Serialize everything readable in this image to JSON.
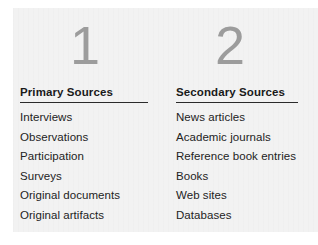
{
  "figure": {
    "background_color": "#ffffff",
    "panel_color": "#f2f2f2",
    "numeral_color": "#9c9c9c",
    "heading_color": "#1a1a1a",
    "text_color": "#232323",
    "rule_color": "#2b2b2b"
  },
  "columns": [
    {
      "number": "1",
      "heading": "Primary Sources",
      "items": [
        "Interviews",
        "Observations",
        "Participation",
        "Surveys",
        "Original documents",
        "Original artifacts"
      ]
    },
    {
      "number": "2",
      "heading": "Secondary Sources",
      "items": [
        "News articles",
        "Academic journals",
        "Reference book entries",
        "Books",
        "Web sites",
        "Databases"
      ]
    }
  ]
}
